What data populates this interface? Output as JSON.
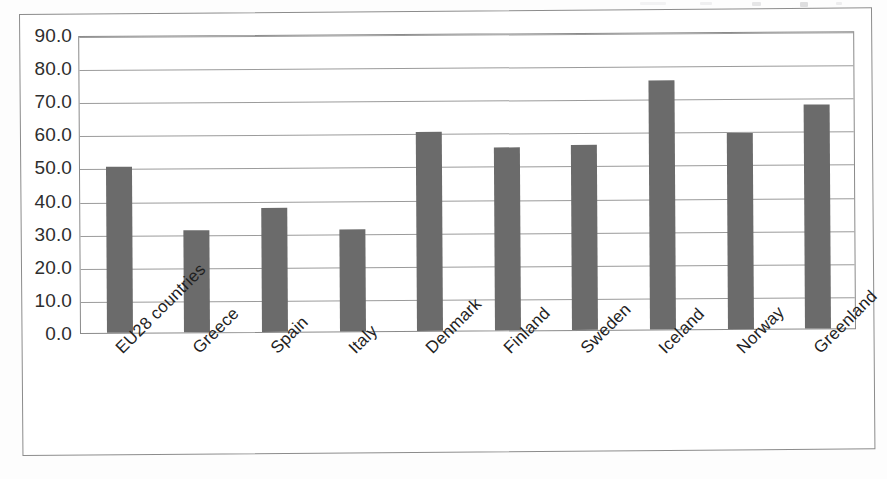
{
  "chart_data": {
    "type": "bar",
    "title": "",
    "subtitle": "",
    "xlabel": "",
    "ylabel": "",
    "categories": [
      "EU28 countries",
      "Greece",
      "Spain",
      "Italy",
      "Denmark",
      "Finland",
      "Sweden",
      "Iceland",
      "Norway",
      "Greenland"
    ],
    "values": [
      50.0,
      30.7,
      37.5,
      30.8,
      60.0,
      55.4,
      55.8,
      75.3,
      59.1,
      67.8
    ],
    "ylim": [
      0,
      90
    ],
    "ytick_step": 10,
    "ytick_labels": [
      "0.0",
      "10.0",
      "20.0",
      "30.0",
      "40.0",
      "50.0",
      "60.0",
      "70.0",
      "80.0",
      "90.0"
    ],
    "grid": true,
    "legend": "none",
    "bar_color": "#6b6b6b",
    "gridline_color": "#9b9b9b",
    "plot_border_color": "#8a8a8a",
    "background_color": "#ffffff",
    "label_rotation_deg": -45,
    "series": [
      {
        "name": "value",
        "values": [
          50.0,
          30.7,
          37.5,
          30.8,
          60.0,
          55.4,
          55.8,
          75.3,
          59.1,
          67.8
        ]
      }
    ]
  }
}
